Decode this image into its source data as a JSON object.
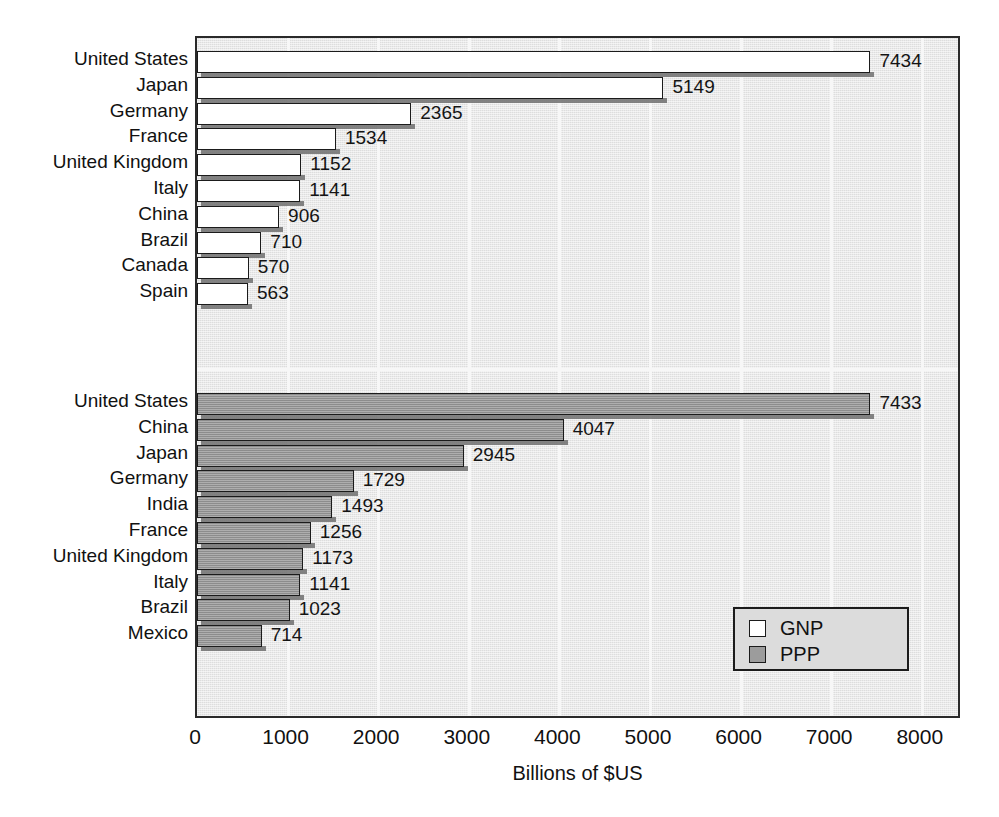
{
  "chart_data": {
    "type": "bar",
    "orientation": "horizontal",
    "title": "",
    "subtitle": "",
    "xlabel": "Billions of $US",
    "ylabel": "",
    "xlim": [
      0,
      8400
    ],
    "xticks": [
      0,
      1000,
      2000,
      3000,
      4000,
      5000,
      6000,
      7000,
      8000
    ],
    "xtick_labels": [
      "0",
      "1000",
      "2000",
      "3000",
      "4000",
      "5000",
      "6000",
      "7000",
      "8000"
    ],
    "grid": true,
    "grid_axis": "x",
    "legend_position": "lower-right",
    "legend": [
      {
        "label": "GNP",
        "swatch": "white"
      },
      {
        "label": "PPP",
        "swatch": "gray"
      }
    ],
    "panels": [
      {
        "name": "GNP",
        "series_label": "GNP",
        "categories": [
          "United States",
          "Japan",
          "Germany",
          "France",
          "United Kingdom",
          "Italy",
          "China",
          "Brazil",
          "Canada",
          "Spain"
        ],
        "values": [
          7434,
          5149,
          2365,
          1534,
          1152,
          1141,
          906,
          710,
          570,
          563
        ],
        "value_labels": [
          "7434",
          "5149",
          "2365",
          "1534",
          "1152",
          "1141",
          "906",
          "710",
          "570",
          "563"
        ]
      },
      {
        "name": "PPP",
        "series_label": "PPP",
        "categories": [
          "United States",
          "China",
          "Japan",
          "Germany",
          "India",
          "France",
          "United Kingdom",
          "Italy",
          "Brazil",
          "Mexico"
        ],
        "values": [
          7433,
          4047,
          2945,
          1729,
          1493,
          1256,
          1173,
          1141,
          1023,
          714
        ],
        "value_labels": [
          "7433",
          "4047",
          "2945",
          "1729",
          "1493",
          "1256",
          "1173",
          "1141",
          "1023",
          "714"
        ]
      }
    ]
  },
  "colors": {
    "plot_background": "#dddddd",
    "gnp_bar": "#ffffff",
    "ppp_bar": "#9c9c9c",
    "axis": "#2a2a2a",
    "gridline": "#f7f7f7",
    "text": "#111111"
  },
  "artifacts": {
    "bleed_top": "",
    "bleed_mid": "",
    "bleed_bottom": ""
  }
}
